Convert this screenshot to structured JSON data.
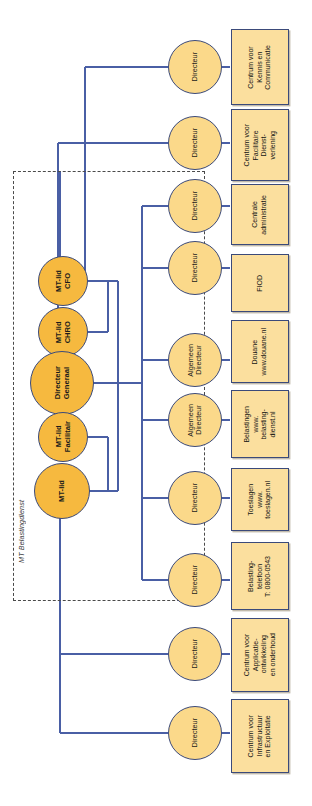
{
  "diagram": {
    "orientation": "rotated-90",
    "colors": {
      "primary_node": "#f6b93f",
      "secondary_node": "#fbd98a",
      "box_fill": "#fbdf9e",
      "stroke": "#3b4a7a",
      "group_border": "#4a4a4a"
    }
  },
  "group": {
    "label": "MT Belastingdienst"
  },
  "mt_nodes": [
    {
      "label": "MT-lid\nCFO"
    },
    {
      "label": "MT-lid\nCHRO"
    },
    {
      "label": "Directeur\nGeneraal"
    },
    {
      "label": "MT-lid\nFacilitair"
    },
    {
      "label": "MT-lid"
    }
  ],
  "director_nodes": [
    {
      "label": "Directeur"
    },
    {
      "label": "Directeur"
    },
    {
      "label": "Directeur"
    },
    {
      "label": "Directeur"
    },
    {
      "label": "Algemeen\nDirecteur"
    },
    {
      "label": "Algemeen\nDirecteur"
    },
    {
      "label": "Directeur"
    },
    {
      "label": "Directeur"
    },
    {
      "label": "Directeur"
    },
    {
      "label": "Directeur"
    }
  ],
  "units": [
    {
      "label": "Centrum voor\nKennis en\nCommunicatie"
    },
    {
      "label": "Centrum voor\nFacilitaire\nDienst-\nverlening"
    },
    {
      "label": "Centrale\nadministratie"
    },
    {
      "label": "FIOD"
    },
    {
      "label": "Douane\nwww.douane.nl"
    },
    {
      "label": "Belastingen\nwww.\nbelasting-\ndienst.nl"
    },
    {
      "label": "Toeslagen\nwww.\ntoeslagen.nl"
    },
    {
      "label": "Belasting-\ntelefoon\nT: 0800-0543"
    },
    {
      "label": "Centrum voor\nApplicatie-\nontwikkeling\nen onderhoud"
    },
    {
      "label": "Centrum voor\nInfrastructuur\nen Exploitatie"
    }
  ]
}
